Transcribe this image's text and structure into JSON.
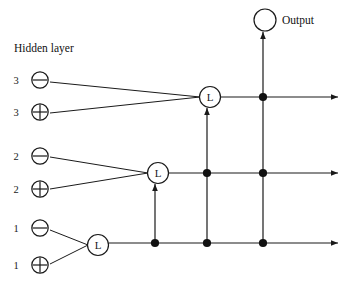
{
  "figure": {
    "type": "network-diagram",
    "title_label": "Hidden layer",
    "output_label": "Output"
  },
  "labels": {
    "hidden_layer": "Hidden layer",
    "output": "Output"
  },
  "hidden_units": [
    {
      "index": "3",
      "symbol": "⊖",
      "symbol_name": "circled-minus",
      "x": 40,
      "y": 80,
      "label_x": 16,
      "label_y": 80
    },
    {
      "index": "3",
      "symbol": "⊕",
      "symbol_name": "circled-plus",
      "x": 40,
      "y": 112,
      "label_x": 16,
      "label_y": 112
    },
    {
      "index": "2",
      "symbol": "⊖",
      "symbol_name": "circled-minus",
      "x": 40,
      "y": 156,
      "label_x": 16,
      "label_y": 156
    },
    {
      "index": "2",
      "symbol": "⊕",
      "symbol_name": "circled-plus",
      "x": 40,
      "y": 189,
      "label_x": 16,
      "label_y": 189
    },
    {
      "index": "1",
      "symbol": "⊖",
      "symbol_name": "circled-minus",
      "x": 40,
      "y": 228,
      "label_x": 16,
      "label_y": 228
    },
    {
      "index": "1",
      "symbol": "⊕",
      "symbol_name": "circled-plus",
      "x": 40,
      "y": 265,
      "label_x": 16,
      "label_y": 265
    }
  ],
  "l_nodes": [
    {
      "name": "L1",
      "label": "L",
      "x": 98,
      "y": 245
    },
    {
      "name": "L2",
      "label": "L",
      "x": 158,
      "y": 173
    },
    {
      "name": "L3",
      "label": "L",
      "x": 210,
      "y": 97
    }
  ],
  "output_node": {
    "x": 265,
    "y": 20,
    "r": 11,
    "label": "Output",
    "label_x": 282,
    "label_y": 22
  },
  "bus_columns": [
    155,
    207,
    263
  ],
  "rows": [
    {
      "name": "row-top",
      "y": 97,
      "start_x": 221,
      "end_x": 338
    },
    {
      "name": "row-middle",
      "y": 173,
      "start_x": 169,
      "end_x": 338
    },
    {
      "name": "row-bottom",
      "y": 243,
      "start_x": 109,
      "end_x": 338
    }
  ],
  "junction_dots": [
    {
      "x": 263,
      "y": 97
    },
    {
      "x": 207,
      "y": 173
    },
    {
      "x": 263,
      "y": 173
    },
    {
      "x": 155,
      "y": 243
    },
    {
      "x": 207,
      "y": 243
    },
    {
      "x": 263,
      "y": 243
    }
  ],
  "edges": [
    {
      "from": "hidden-3-minus",
      "to": "L3",
      "x1": 50,
      "y1": 82,
      "x2": 200,
      "y2": 97
    },
    {
      "from": "hidden-3-plus",
      "to": "L3",
      "x1": 50,
      "y1": 113,
      "x2": 200,
      "y2": 97
    },
    {
      "from": "hidden-2-minus",
      "to": "L2",
      "x1": 50,
      "y1": 157,
      "x2": 148,
      "y2": 173
    },
    {
      "from": "hidden-2-plus",
      "to": "L2",
      "x1": 50,
      "y1": 189,
      "x2": 148,
      "y2": 173
    },
    {
      "from": "hidden-1-minus",
      "to": "L1",
      "x1": 50,
      "y1": 230,
      "x2": 88,
      "y2": 245
    },
    {
      "from": "hidden-1-plus",
      "to": "L1",
      "x1": 50,
      "y1": 264,
      "x2": 88,
      "y2": 245
    }
  ],
  "vertical_arrows": [
    {
      "name": "bottom-to-L2",
      "x": 155,
      "y_from": 243,
      "y_to": 184
    },
    {
      "name": "bottom-to-L3",
      "x": 207,
      "y_from": 243,
      "y_to": 108
    },
    {
      "name": "bottom-to-output",
      "x": 263,
      "y_from": 243,
      "y_to": 32
    }
  ],
  "style": {
    "stroke": "#1a1a1a",
    "fill": "#ffffff",
    "dot_fill": "#111111"
  }
}
